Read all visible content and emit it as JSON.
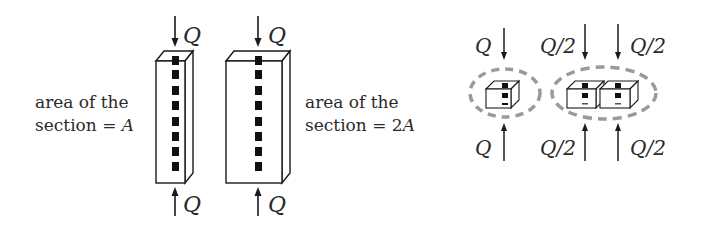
{
  "left_figure": {
    "label_a_line1": "area of the",
    "label_a_line2": "section = ",
    "label_a_var": "A",
    "label_2a_line1": "area of the",
    "label_2a_line2": "section = 2",
    "label_2a_var": "A",
    "column1": {
      "top_force": "Q",
      "bottom_force": "Q"
    },
    "column2": {
      "top_force": "Q",
      "bottom_force": "Q"
    }
  },
  "right_figure": {
    "single_element": {
      "top_force": "Q",
      "bottom_force": "Q"
    },
    "pair_left": {
      "top_force": "Q/2",
      "bottom_force": "Q/2"
    },
    "pair_right": {
      "top_force": "Q/2",
      "bottom_force": "Q/2"
    }
  },
  "colors": {
    "line": "#1a1a1a",
    "marker": "#111111",
    "dashed_ellipse": "#9a9a9a"
  }
}
